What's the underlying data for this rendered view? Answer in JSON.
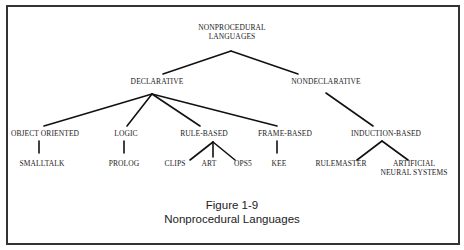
{
  "diagram": {
    "root": "NONPROCEDURAL\nLANGUAGES",
    "level1": [
      "DECLARATIVE",
      "NONDECLARATIVE"
    ],
    "level2": [
      "OBJECT ORIENTED",
      "LOGIC",
      "RULE-BASED",
      "FRAME-BASED",
      "INDUCTION-BASED"
    ],
    "level3": [
      "SMALLTALK",
      "PROLOG",
      "CLIPS",
      "ART",
      "OPS5",
      "KEE",
      "RULEMASTER",
      "ARTIFICIAL\nNEURAL SYSTEMS"
    ],
    "edges": [
      [
        "NONPROCEDURAL LANGUAGES",
        "DECLARATIVE"
      ],
      [
        "NONPROCEDURAL LANGUAGES",
        "NONDECLARATIVE"
      ],
      [
        "DECLARATIVE",
        "OBJECT ORIENTED"
      ],
      [
        "DECLARATIVE",
        "LOGIC"
      ],
      [
        "DECLARATIVE",
        "RULE-BASED"
      ],
      [
        "DECLARATIVE",
        "FRAME-BASED"
      ],
      [
        "NONDECLARATIVE",
        "INDUCTION-BASED"
      ],
      [
        "OBJECT ORIENTED",
        "SMALLTALK"
      ],
      [
        "LOGIC",
        "PROLOG"
      ],
      [
        "RULE-BASED",
        "CLIPS"
      ],
      [
        "RULE-BASED",
        "ART"
      ],
      [
        "RULE-BASED",
        "OPS5"
      ],
      [
        "FRAME-BASED",
        "KEE"
      ],
      [
        "INDUCTION-BASED",
        "RULEMASTER"
      ],
      [
        "INDUCTION-BASED",
        "ARTIFICIAL NEURAL SYSTEMS"
      ]
    ]
  },
  "labels": {
    "root_line1": "NONPROCEDURAL",
    "root_line2": "LANGUAGES",
    "declarative": "DECLARATIVE",
    "nondeclarative": "NONDECLARATIVE",
    "object_oriented": "OBJECT ORIENTED",
    "logic": "LOGIC",
    "rule_based": "RULE-BASED",
    "frame_based": "FRAME-BASED",
    "induction_based": "INDUCTION-BASED",
    "smalltalk": "SMALLTALK",
    "prolog": "PROLOG",
    "clips": "CLIPS",
    "art": "ART",
    "ops5": "OPS5",
    "kee": "KEE",
    "rulemaster": "RULEMASTER",
    "ans_line1": "ARTIFICIAL",
    "ans_line2": "NEURAL SYSTEMS"
  },
  "caption": {
    "figure_number": "Figure 1-9",
    "title": "Nonprocedural Languages"
  },
  "colors": {
    "line": "#111111",
    "border": "#333333",
    "text": "#222222"
  }
}
